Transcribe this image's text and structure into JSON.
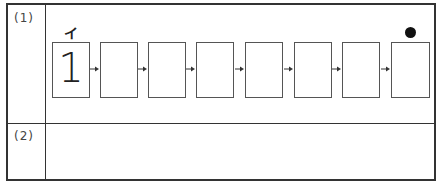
{
  "worksheet": {
    "rows": [
      {
        "label": "(1)"
      },
      {
        "label": "(2)"
      }
    ],
    "sequence": {
      "first_box_value": "1",
      "first_box_annotation": "イ",
      "box_count": 8,
      "end_marker": "filled-circle"
    },
    "colors": {
      "border": "#333333",
      "box_border": "#555555",
      "dot": "#111111"
    }
  }
}
